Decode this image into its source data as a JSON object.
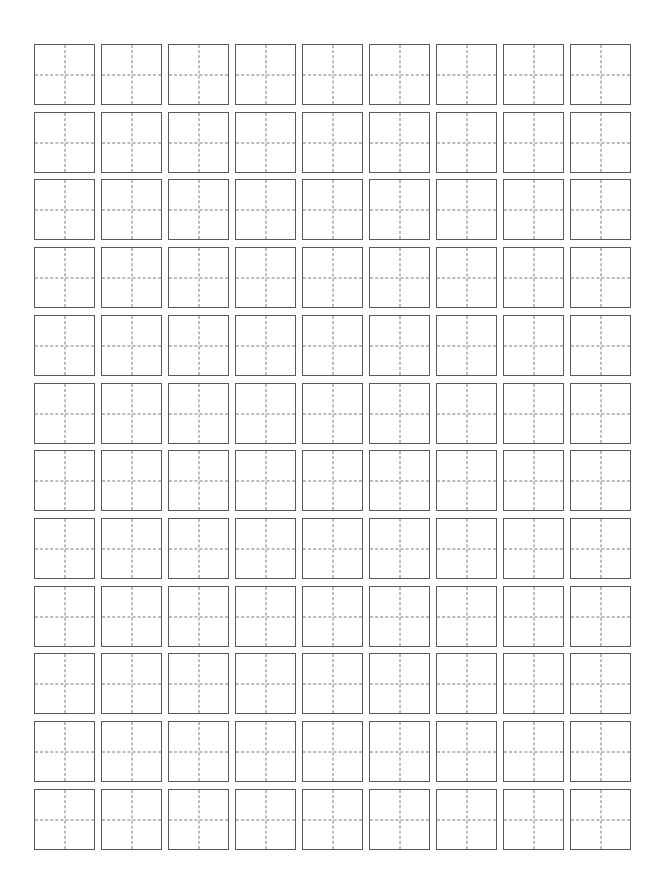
{
  "worksheet": {
    "type": "tianzige-practice-grid",
    "rows": 12,
    "columns": 9,
    "cell_size_px": 61,
    "pitch_x_px": 67,
    "pitch_y_px": 67.7,
    "border_color": "#5a5a5a",
    "guide_color": "#7a7a7a",
    "guide_style": "dashed",
    "background": "#ffffff",
    "cells_content": []
  }
}
